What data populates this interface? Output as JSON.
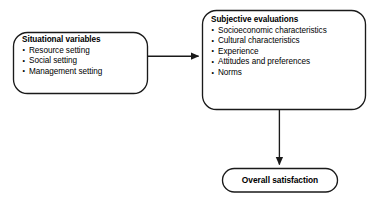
{
  "diagram": {
    "stroke_color": "#1a1a1a",
    "fill_color": "#ffffff",
    "text_color": "#000000",
    "nodes": [
      {
        "id": "situational-variables",
        "shape": "rounded-rectangle",
        "heading": "Situational variables",
        "items": [
          "Resource setting",
          "Social setting",
          "Management setting"
        ]
      },
      {
        "id": "subjective-evaluations",
        "shape": "rounded-rectangle",
        "heading": "Subjective evaluations",
        "items": [
          "Socioeconomic characteristics",
          "Cultural characteristics",
          "Experience",
          "Attitudes and preferences",
          "Norms"
        ]
      },
      {
        "id": "overall-satisfaction",
        "shape": "stadium",
        "heading": "Overall satisfaction",
        "items": []
      }
    ],
    "edges": [
      {
        "id": "situational-to-subjective",
        "from": "situational-variables",
        "to": "subjective-evaluations",
        "direction": "horizontal-right",
        "arrowhead": "filled-triangle"
      },
      {
        "id": "subjective-to-satisfaction",
        "from": "subjective-evaluations",
        "to": "overall-satisfaction",
        "direction": "vertical-down",
        "arrowhead": "filled-triangle"
      }
    ]
  }
}
